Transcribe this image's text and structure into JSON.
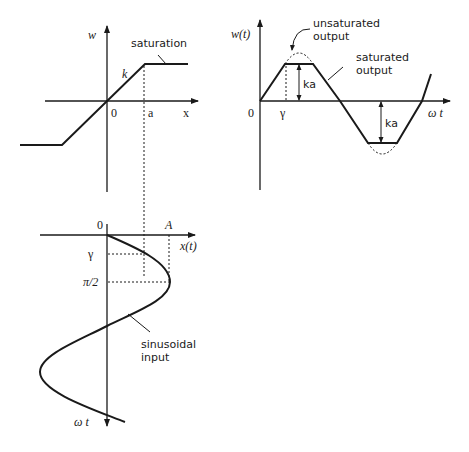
{
  "diagram": {
    "saturation_plot": {
      "y_axis_label": "w",
      "x_axis_label": "x",
      "origin_label": "0",
      "threshold_label": "a",
      "slope_label": "k",
      "annotation": "saturation"
    },
    "output_plot": {
      "y_axis_label": "w(t)",
      "x_axis_label": "ω t",
      "origin_label": "0",
      "gamma_label": "γ",
      "unsaturated_label_line1": "unsaturated",
      "unsaturated_label_line2": "output",
      "saturated_label_line1": "saturated",
      "saturated_label_line2": "output",
      "amplitude_label_top": "ka",
      "amplitude_label_bottom": "ka"
    },
    "input_plot": {
      "origin_label": "0",
      "amplitude_label": "A",
      "x_axis_label": "x(t)",
      "y_axis_label": "ω t",
      "gamma_label": "γ",
      "pi_half_label": "π/2",
      "input_label_line1": "sinusoidal",
      "input_label_line2": "input"
    },
    "colors": {
      "line": "#1a1a1a",
      "background": "#ffffff"
    }
  }
}
